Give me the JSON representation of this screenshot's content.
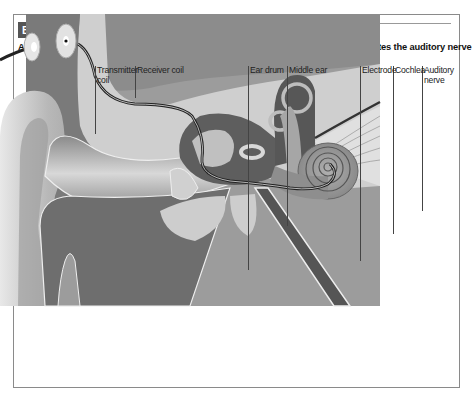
{
  "header": {
    "badge": "BIONIĆ EAR",
    "subtitle": "A cochlear implant is an electrode inserted deep in the inner ear that directly stimulates the auditory nerve"
  },
  "labels": [
    {
      "id": "transmitter-coil",
      "line1": "Transmitter",
      "line2": "coil"
    },
    {
      "id": "receiver-coil",
      "line1": "Receiver coil",
      "line2": ""
    },
    {
      "id": "ear-drum",
      "line1": "Ear drum",
      "line2": ""
    },
    {
      "id": "middle-ear",
      "line1": "Middle ear",
      "line2": ""
    },
    {
      "id": "electrode",
      "line1": "Electrode",
      "line2": ""
    },
    {
      "id": "cochlea",
      "line1": "Cochlea",
      "line2": ""
    },
    {
      "id": "auditory-nerve",
      "line1": "Auditory",
      "line2": "nerve"
    }
  ],
  "colors": {
    "badge_bg": "#555555",
    "frame": "#8a8a8a",
    "tissue_dark": "#6e6e6e",
    "tissue_mid": "#9a9a9a",
    "bone_light": "#cfcfcf",
    "skin": "#bdbdbd"
  }
}
